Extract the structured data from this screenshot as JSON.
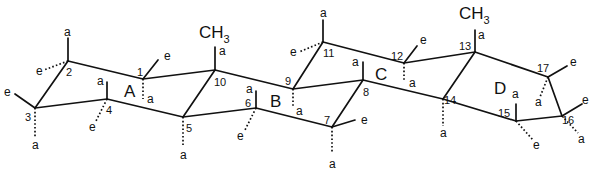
{
  "diagram": {
    "ring_labels": [
      {
        "label": "A",
        "x": 124,
        "y": 97
      },
      {
        "label": "B",
        "x": 270,
        "y": 107
      },
      {
        "label": "C",
        "x": 375,
        "y": 80
      },
      {
        "label": "D",
        "x": 494,
        "y": 94
      }
    ],
    "atoms": [
      {
        "id": "1",
        "x": 143,
        "y": 79
      },
      {
        "id": "2",
        "x": 68,
        "y": 61
      },
      {
        "id": "3",
        "x": 35,
        "y": 108
      },
      {
        "id": "4",
        "x": 107,
        "y": 99
      },
      {
        "id": "5",
        "x": 183,
        "y": 117
      },
      {
        "id": "6",
        "x": 256,
        "y": 108
      },
      {
        "id": "7",
        "x": 332,
        "y": 127
      },
      {
        "id": "8",
        "x": 363,
        "y": 80
      },
      {
        "id": "9",
        "x": 293,
        "y": 89
      },
      {
        "id": "10",
        "x": 215,
        "y": 70
      },
      {
        "id": "11",
        "x": 323,
        "y": 42
      },
      {
        "id": "12",
        "x": 404,
        "y": 63
      },
      {
        "id": "13",
        "x": 475,
        "y": 52
      },
      {
        "id": "14",
        "x": 443,
        "y": 99
      },
      {
        "id": "15",
        "x": 516,
        "y": 121
      },
      {
        "id": "16",
        "x": 562,
        "y": 116
      },
      {
        "id": "17",
        "x": 548,
        "y": 77
      }
    ],
    "atom_number_labels": [
      {
        "text": "1",
        "x": 137,
        "y": 76
      },
      {
        "text": "2",
        "x": 66,
        "y": 76
      },
      {
        "text": "3",
        "x": 25,
        "y": 121
      },
      {
        "text": "4",
        "x": 106,
        "y": 114
      },
      {
        "text": "5",
        "x": 186,
        "y": 132
      },
      {
        "text": "6",
        "x": 245,
        "y": 107
      },
      {
        "text": "7",
        "x": 324,
        "y": 124
      },
      {
        "text": "8",
        "x": 363,
        "y": 96
      },
      {
        "text": "9",
        "x": 285,
        "y": 85
      },
      {
        "text": "10",
        "x": 214,
        "y": 86
      },
      {
        "text": "11",
        "x": 323,
        "y": 57
      },
      {
        "text": "12",
        "x": 391,
        "y": 60
      },
      {
        "text": "13",
        "x": 459,
        "y": 50
      },
      {
        "text": "14",
        "x": 444,
        "y": 104
      },
      {
        "text": "15",
        "x": 498,
        "y": 117
      },
      {
        "text": "16",
        "x": 562,
        "y": 124
      },
      {
        "text": "17",
        "x": 537,
        "y": 72
      }
    ],
    "methyl_groups": [
      {
        "text": "CH",
        "sub": "3",
        "x": 199,
        "y": 38
      },
      {
        "text": "CH",
        "sub": "3",
        "x": 459,
        "y": 19
      }
    ],
    "substituent_labels": [
      {
        "text": "a",
        "x": 64,
        "y": 36
      },
      {
        "text": "e",
        "x": 36,
        "y": 75
      },
      {
        "text": "e",
        "x": 164,
        "y": 60
      },
      {
        "text": "a",
        "x": 147,
        "y": 103
      },
      {
        "text": "e",
        "x": 4,
        "y": 96
      },
      {
        "text": "a",
        "x": 32,
        "y": 149
      },
      {
        "text": "a",
        "x": 97,
        "y": 85
      },
      {
        "text": "e",
        "x": 89,
        "y": 131
      },
      {
        "text": "a",
        "x": 180,
        "y": 159
      },
      {
        "text": "a",
        "x": 219,
        "y": 55
      },
      {
        "text": "a",
        "x": 246,
        "y": 93
      },
      {
        "text": "e",
        "x": 237,
        "y": 140
      },
      {
        "text": "a",
        "x": 296,
        "y": 115
      },
      {
        "text": "a",
        "x": 320,
        "y": 17
      },
      {
        "text": "e",
        "x": 290,
        "y": 56
      },
      {
        "text": "a",
        "x": 352,
        "y": 66
      },
      {
        "text": "e",
        "x": 361,
        "y": 124
      },
      {
        "text": "a",
        "x": 329,
        "y": 168
      },
      {
        "text": "e",
        "x": 420,
        "y": 44
      },
      {
        "text": "a",
        "x": 409,
        "y": 87
      },
      {
        "text": "a",
        "x": 478,
        "y": 39
      },
      {
        "text": "a",
        "x": 440,
        "y": 137
      },
      {
        "text": "a",
        "x": 512,
        "y": 98
      },
      {
        "text": "e",
        "x": 533,
        "y": 149
      },
      {
        "text": "e",
        "x": 570,
        "y": 66
      },
      {
        "text": "a",
        "x": 535,
        "y": 106
      },
      {
        "text": "e",
        "x": 582,
        "y": 104
      },
      {
        "text": "a",
        "x": 578,
        "y": 143
      }
    ]
  }
}
